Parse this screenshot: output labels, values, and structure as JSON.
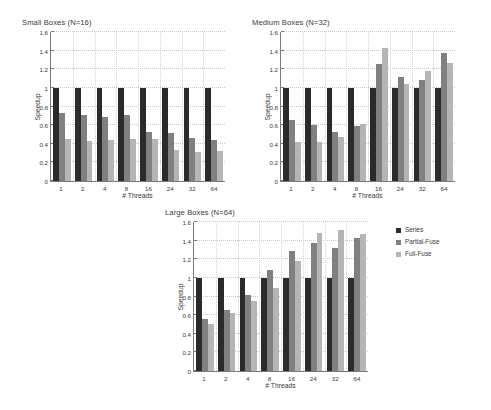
{
  "figure": {
    "xlabel": "# Threads",
    "ylabel": "Speedup",
    "ytick_labels": [
      "0",
      "0.2",
      "0.4",
      "0.6",
      "0.8",
      "1",
      "1.2",
      "1.4",
      "1.6"
    ],
    "categories": [
      "1",
      "2",
      "4",
      "8",
      "16",
      "24",
      "32",
      "64"
    ]
  },
  "legend": {
    "items": [
      {
        "label": "Series",
        "color": "#2b2b2b"
      },
      {
        "label": "Partial-Fuse",
        "color": "#808080"
      },
      {
        "label": "Full-Fuse",
        "color": "#b5b5b5"
      }
    ]
  },
  "chart_data": [
    {
      "type": "bar",
      "title": "Small Boxes (N=16)",
      "xlabel": "# Threads",
      "ylabel": "Speedup",
      "categories": [
        "1",
        "2",
        "4",
        "8",
        "16",
        "24",
        "32",
        "64"
      ],
      "ylim": [
        0,
        1.6
      ],
      "yticks": [
        0,
        0.2,
        0.4,
        0.6,
        0.8,
        1.0,
        1.2,
        1.4,
        1.6
      ],
      "grid": true,
      "legend_position": "none",
      "series": [
        {
          "name": "Series",
          "color": "#2b2b2b",
          "values": [
            1.0,
            1.0,
            1.0,
            1.0,
            1.0,
            1.0,
            1.0,
            1.0
          ]
        },
        {
          "name": "Partial-Fuse",
          "color": "#808080",
          "values": [
            0.73,
            0.71,
            0.69,
            0.71,
            0.53,
            0.52,
            0.46,
            0.44
          ]
        },
        {
          "name": "Full-Fuse",
          "color": "#b5b5b5",
          "values": [
            0.45,
            0.43,
            0.44,
            0.45,
            0.45,
            0.33,
            0.31,
            0.32
          ]
        }
      ]
    },
    {
      "type": "bar",
      "title": "Medium Boxes (N=32)",
      "xlabel": "# Threads",
      "ylabel": "Speedup",
      "categories": [
        "1",
        "2",
        "4",
        "8",
        "16",
        "24",
        "32",
        "64"
      ],
      "ylim": [
        0,
        1.6
      ],
      "yticks": [
        0,
        0.2,
        0.4,
        0.6,
        0.8,
        1.0,
        1.2,
        1.4,
        1.6
      ],
      "grid": true,
      "legend_position": "none",
      "series": [
        {
          "name": "Series",
          "color": "#2b2b2b",
          "values": [
            1.0,
            1.0,
            1.0,
            1.0,
            1.0,
            1.0,
            1.0,
            1.0
          ]
        },
        {
          "name": "Partial-Fuse",
          "color": "#808080",
          "values": [
            0.65,
            0.6,
            0.53,
            0.59,
            1.26,
            1.12,
            1.08,
            1.38
          ]
        },
        {
          "name": "Full-Fuse",
          "color": "#b5b5b5",
          "values": [
            0.42,
            0.42,
            0.47,
            0.61,
            1.43,
            1.04,
            1.18,
            1.27
          ]
        }
      ]
    },
    {
      "type": "bar",
      "title": "Large Boxes (N=64)",
      "xlabel": "# Threads",
      "ylabel": "Speedup",
      "categories": [
        "1",
        "2",
        "4",
        "8",
        "16",
        "24",
        "32",
        "64"
      ],
      "ylim": [
        0,
        1.6
      ],
      "yticks": [
        0,
        0.2,
        0.4,
        0.6,
        0.8,
        1.0,
        1.2,
        1.4,
        1.6
      ],
      "grid": true,
      "legend_position": "right",
      "series": [
        {
          "name": "Series",
          "color": "#2b2b2b",
          "values": [
            1.0,
            1.0,
            1.0,
            1.0,
            1.0,
            1.0,
            1.0,
            1.0
          ]
        },
        {
          "name": "Partial-Fuse",
          "color": "#808080",
          "values": [
            0.56,
            0.66,
            0.82,
            1.09,
            1.29,
            1.37,
            1.32,
            1.43
          ]
        },
        {
          "name": "Full-Fuse",
          "color": "#b5b5b5",
          "values": [
            0.51,
            0.62,
            0.75,
            0.89,
            1.18,
            1.48,
            1.51,
            1.47
          ]
        }
      ]
    }
  ]
}
